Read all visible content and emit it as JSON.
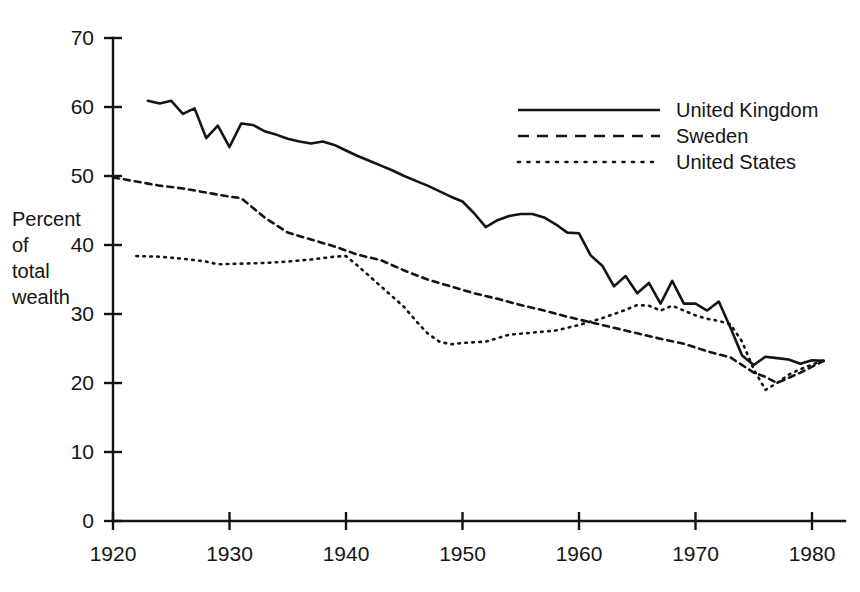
{
  "chart_data": {
    "type": "line",
    "title": "",
    "subtitle": "",
    "xlabel": "",
    "ylabel": "Percent of total wealth",
    "ylabel_lines": [
      "Percent",
      "of",
      "total",
      "wealth"
    ],
    "xlim": [
      1920,
      1982
    ],
    "ylim": [
      0,
      70
    ],
    "xticks": [
      1920,
      1930,
      1940,
      1950,
      1960,
      1970,
      1980
    ],
    "xtick_labels": [
      "1920",
      "1930",
      "1940",
      "1950",
      "1960",
      "1970",
      "1980"
    ],
    "yticks": [
      0,
      10,
      20,
      30,
      40,
      50,
      60,
      70
    ],
    "ytick_labels": [
      "0",
      "10",
      "20",
      "30",
      "40",
      "50",
      "60",
      "70"
    ],
    "grid": false,
    "legend_position": "top-right",
    "series": [
      {
        "name": "United Kingdom",
        "style": "solid",
        "x": [
          1923,
          1924,
          1925,
          1926,
          1927,
          1928,
          1929,
          1930,
          1931,
          1932,
          1933,
          1934,
          1935,
          1936,
          1937,
          1938,
          1939,
          1940,
          1941,
          1942,
          1943,
          1944,
          1945,
          1946,
          1947,
          1948,
          1949,
          1950,
          1951,
          1952,
          1953,
          1954,
          1955,
          1956,
          1957,
          1958,
          1959,
          1960,
          1961,
          1962,
          1963,
          1964,
          1965,
          1966,
          1967,
          1968,
          1969,
          1970,
          1971,
          1972,
          1973,
          1974,
          1975,
          1976,
          1977,
          1978,
          1979,
          1980,
          1981
        ],
        "values": [
          60.9,
          60.5,
          60.9,
          59.0,
          59.8,
          55.5,
          57.3,
          54.2,
          57.6,
          57.4,
          56.5,
          56.0,
          55.4,
          55.0,
          54.7,
          55.0,
          54.5,
          53.7,
          52.9,
          52.2,
          51.5,
          50.8,
          50.0,
          49.3,
          48.6,
          47.8,
          47.0,
          46.3,
          44.6,
          42.6,
          43.6,
          44.2,
          44.5,
          44.5,
          44.0,
          43.0,
          41.8,
          41.7,
          38.5,
          37.0,
          34.0,
          35.5,
          33.0,
          34.5,
          31.5,
          34.8,
          31.5,
          31.5,
          30.5,
          31.8,
          28.0,
          24.0,
          22.6,
          23.8,
          23.6,
          23.4,
          22.8,
          23.3,
          23.2
        ]
      },
      {
        "name": "Sweden",
        "style": "dashed",
        "x": [
          1920,
          1922,
          1924,
          1926,
          1928,
          1930,
          1931,
          1933,
          1935,
          1937,
          1939,
          1941,
          1943,
          1945,
          1947,
          1949,
          1951,
          1953,
          1955,
          1957,
          1959,
          1961,
          1963,
          1965,
          1967,
          1969,
          1971,
          1973,
          1975,
          1976,
          1977,
          1979,
          1981
        ],
        "values": [
          49.8,
          49.2,
          48.6,
          48.2,
          47.6,
          47.0,
          46.8,
          44.0,
          41.8,
          40.8,
          39.8,
          38.6,
          37.8,
          36.3,
          35.0,
          34.0,
          33.0,
          32.2,
          31.3,
          30.5,
          29.6,
          28.8,
          28.0,
          27.2,
          26.4,
          25.7,
          24.6,
          23.7,
          21.5,
          20.9,
          20.0,
          21.5,
          23.2
        ]
      },
      {
        "name": "United States",
        "style": "dotted",
        "x": [
          1922,
          1924,
          1926,
          1928,
          1929,
          1931,
          1933,
          1935,
          1937,
          1939,
          1940,
          1941,
          1943,
          1945,
          1946,
          1947,
          1948,
          1949,
          1950,
          1952,
          1954,
          1956,
          1958,
          1960,
          1962,
          1963,
          1964,
          1965,
          1966,
          1967,
          1968,
          1969,
          1970,
          1971,
          1972,
          1973,
          1974,
          1975,
          1976,
          1977,
          1978,
          1979,
          1981
        ],
        "values": [
          38.4,
          38.3,
          38.0,
          37.6,
          37.2,
          37.3,
          37.4,
          37.6,
          37.9,
          38.3,
          38.4,
          37.0,
          34.0,
          31.0,
          29.0,
          27.2,
          26.0,
          25.6,
          25.8,
          26.0,
          27.0,
          27.3,
          27.6,
          28.4,
          29.4,
          30.0,
          30.6,
          31.3,
          31.2,
          30.5,
          31.2,
          30.5,
          29.8,
          29.3,
          29.0,
          28.5,
          26.0,
          22.0,
          19.0,
          20.0,
          21.2,
          22.0,
          23.3
        ]
      }
    ]
  },
  "legend": {
    "items": [
      {
        "label": "United Kingdom",
        "style": "solid"
      },
      {
        "label": "Sweden",
        "style": "dashed"
      },
      {
        "label": "United States",
        "style": "dotted"
      }
    ]
  },
  "colors": {
    "ink": "#141414",
    "background": "#ffffff"
  }
}
